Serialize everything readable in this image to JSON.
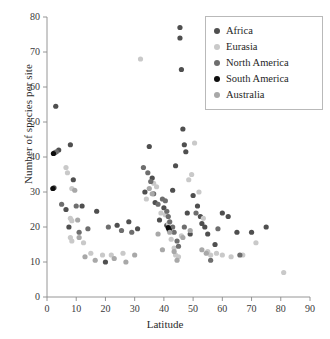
{
  "chart_data": {
    "type": "scatter",
    "title": "",
    "xlabel": "Latitude",
    "ylabel": "Number of species per site",
    "xlim": [
      0,
      90
    ],
    "ylim": [
      0,
      80
    ],
    "xticks": [
      0,
      10,
      20,
      30,
      40,
      50,
      60,
      70,
      80,
      90
    ],
    "yticks": [
      0,
      10,
      20,
      30,
      40,
      50,
      60,
      70,
      80
    ],
    "grid": false,
    "legend_position": "top-right",
    "series": [
      {
        "name": "Africa",
        "color": "#4f4f4f",
        "points": [
          [
            3.0,
            54.5
          ],
          [
            4.0,
            42.0
          ],
          [
            2.6,
            41.2
          ],
          [
            2.4,
            31.2
          ],
          [
            8.0,
            43.5
          ],
          [
            9.0,
            33.5
          ],
          [
            6.5,
            25.0
          ],
          [
            7.5,
            20.0
          ],
          [
            12.0,
            26.0
          ],
          [
            17.0,
            24.5
          ],
          [
            20.0,
            10.0
          ],
          [
            24.0,
            20.5
          ],
          [
            28.0,
            21.5
          ],
          [
            31.0,
            19.5
          ],
          [
            33.5,
            30.0
          ],
          [
            35.0,
            43.0
          ],
          [
            36.0,
            34.0
          ],
          [
            37.0,
            27.0
          ],
          [
            38.5,
            22.0
          ],
          [
            40.0,
            25.5
          ],
          [
            41.0,
            20.5
          ],
          [
            42.0,
            19.5
          ],
          [
            43.0,
            30.5
          ],
          [
            44.0,
            37.5
          ],
          [
            45.5,
            77.0
          ],
          [
            45.5,
            74.0
          ],
          [
            46.0,
            65.0
          ],
          [
            46.5,
            48.0
          ],
          [
            47.0,
            43.5
          ],
          [
            47.5,
            41.5
          ],
          [
            48.0,
            24.0
          ],
          [
            49.0,
            18.0
          ],
          [
            50.0,
            29.0
          ],
          [
            51.5,
            26.0
          ],
          [
            52.5,
            23.0
          ],
          [
            53.0,
            21.0
          ],
          [
            54.0,
            20.0
          ],
          [
            55.0,
            18.0
          ],
          [
            57.5,
            15.0
          ],
          [
            60.0,
            24.0
          ],
          [
            62.0,
            23.0
          ],
          [
            65.0,
            18.5
          ],
          [
            70.0,
            18.5
          ],
          [
            75.0,
            20.0
          ]
        ]
      },
      {
        "name": "Eurasia",
        "color": "#c9c9c9",
        "points": [
          [
            6.5,
            37.0
          ],
          [
            7.0,
            35.5
          ],
          [
            8.5,
            31.0
          ],
          [
            8.0,
            22.5
          ],
          [
            8.5,
            21.8
          ],
          [
            8.0,
            17.0
          ],
          [
            8.5,
            16.0
          ],
          [
            12.5,
            15.5
          ],
          [
            15.0,
            12.5
          ],
          [
            19.0,
            12.0
          ],
          [
            22.0,
            12.0
          ],
          [
            26.0,
            12.5
          ],
          [
            32.0,
            68.0
          ],
          [
            34.0,
            28.0
          ],
          [
            36.5,
            32.5
          ],
          [
            37.5,
            31.5
          ],
          [
            39.0,
            24.0
          ],
          [
            40.5,
            23.5
          ],
          [
            41.5,
            21.0
          ],
          [
            42.5,
            16.5
          ],
          [
            43.5,
            14.0
          ],
          [
            44.0,
            12.0
          ],
          [
            45.0,
            11.5
          ],
          [
            46.0,
            17.5
          ],
          [
            48.5,
            33.5
          ],
          [
            49.5,
            35.0
          ],
          [
            50.5,
            44.0
          ],
          [
            52.0,
            30.0
          ],
          [
            53.5,
            22.5
          ],
          [
            55.0,
            13.0
          ],
          [
            56.0,
            12.0
          ],
          [
            58.0,
            12.5
          ],
          [
            60.0,
            12.0
          ],
          [
            63.0,
            11.5
          ],
          [
            67.0,
            12.0
          ],
          [
            71.5,
            15.5
          ],
          [
            81.0,
            7.0
          ]
        ]
      },
      {
        "name": "North America",
        "color": "#6e6e6e",
        "points": [
          [
            3.2,
            41.5
          ],
          [
            5.0,
            26.5
          ],
          [
            10.0,
            26.0
          ],
          [
            11.0,
            18.5
          ],
          [
            14.0,
            19.5
          ],
          [
            21.0,
            20.0
          ],
          [
            25.5,
            19.0
          ],
          [
            29.0,
            18.5
          ],
          [
            33.0,
            37.0
          ],
          [
            34.5,
            35.5
          ],
          [
            35.5,
            33.0
          ],
          [
            36.5,
            29.5
          ],
          [
            38.0,
            26.5
          ],
          [
            39.5,
            28.0
          ],
          [
            40.5,
            27.5
          ],
          [
            41.0,
            24.5
          ],
          [
            41.5,
            23.0
          ],
          [
            42.0,
            21.5
          ],
          [
            43.0,
            20.0
          ],
          [
            43.5,
            18.5
          ],
          [
            44.5,
            16.0
          ],
          [
            45.0,
            14.5
          ],
          [
            47.0,
            20.0
          ],
          [
            51.0,
            24.0
          ],
          [
            56.0,
            10.5
          ],
          [
            58.5,
            19.5
          ],
          [
            66.0,
            12.0
          ]
        ]
      },
      {
        "name": "South America",
        "color": "#0d0d0d",
        "points": [
          [
            2.2,
            41.0
          ],
          [
            2.0,
            31.0
          ],
          [
            41.5,
            19.8
          ],
          [
            41.8,
            19.2
          ]
        ]
      },
      {
        "name": "Australia",
        "color": "#a8a8a8",
        "points": [
          [
            9.5,
            30.5
          ],
          [
            10.5,
            22.0
          ],
          [
            11.0,
            17.0
          ],
          [
            13.0,
            11.5
          ],
          [
            16.5,
            10.5
          ],
          [
            23.0,
            11.0
          ],
          [
            27.0,
            10.0
          ],
          [
            30.0,
            12.0
          ],
          [
            35.0,
            31.0
          ],
          [
            36.0,
            29.5
          ],
          [
            38.0,
            18.0
          ],
          [
            39.5,
            13.5
          ],
          [
            42.0,
            18.5
          ],
          [
            43.5,
            13.0
          ],
          [
            44.5,
            10.5
          ],
          [
            46.5,
            17.0
          ],
          [
            49.0,
            19.0
          ],
          [
            53.0,
            13.5
          ],
          [
            54.5,
            12.5
          ]
        ]
      }
    ]
  },
  "legend": {
    "items": [
      {
        "label": "Africa",
        "color": "#4f4f4f"
      },
      {
        "label": "Eurasia",
        "color": "#c9c9c9"
      },
      {
        "label": "North America",
        "color": "#6e6e6e"
      },
      {
        "label": "South America",
        "color": "#0d0d0d"
      },
      {
        "label": "Australia",
        "color": "#a8a8a8"
      }
    ]
  },
  "axes": {
    "x_title": "Latitude",
    "y_title": "Number of species per site"
  }
}
